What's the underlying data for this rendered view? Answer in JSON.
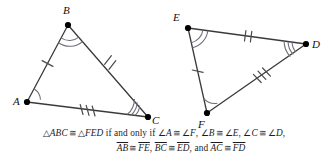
{
  "figure": {
    "stroke_color": "#3a3a3a",
    "mark_color": "#555555",
    "arc_color": "#6f6f7a",
    "vertex_dot_color": "#000000"
  },
  "triangle_left": {
    "name": "ABC",
    "vertices": [
      {
        "label": "A",
        "x": 27,
        "y": 102,
        "label_x": 13,
        "label_y": 105,
        "arcs": 1
      },
      {
        "label": "B",
        "x": 68,
        "y": 25,
        "label_x": 63,
        "label_y": 14,
        "arcs": 2
      },
      {
        "label": "C",
        "x": 148,
        "y": 117,
        "label_x": 152,
        "label_y": 124,
        "arcs": 3
      }
    ],
    "sides": [
      {
        "name": "AB",
        "from": "A",
        "to": "B",
        "ticks": 1
      },
      {
        "name": "BC",
        "from": "B",
        "to": "C",
        "ticks": 2
      },
      {
        "name": "AC",
        "from": "A",
        "to": "C",
        "ticks": 3
      }
    ]
  },
  "triangle_right": {
    "name": "FED",
    "vertices": [
      {
        "label": "E",
        "x": 188,
        "y": 28,
        "label_x": 175,
        "label_y": 21,
        "arcs": 2
      },
      {
        "label": "D",
        "x": 306,
        "y": 44,
        "label_x": 312,
        "label_y": 47,
        "arcs": 3
      },
      {
        "label": "F",
        "x": 207,
        "y": 113,
        "label_x": 199,
        "label_y": 127,
        "arcs": 1
      }
    ],
    "sides": [
      {
        "name": "ED",
        "from": "E",
        "to": "D",
        "ticks": 2
      },
      {
        "name": "EF",
        "from": "E",
        "to": "F",
        "ticks": 1
      },
      {
        "name": "FD",
        "from": "F",
        "to": "D",
        "ticks": 3
      }
    ]
  },
  "caption": {
    "line1": {
      "tri1": "ABC",
      "cong1": "≅",
      "tri2": "FED",
      "connector": "if and only if",
      "angle_pairs": [
        {
          "left": "A",
          "right": "F",
          "sep": ","
        },
        {
          "left": "B",
          "right": "E",
          "sep": ","
        },
        {
          "left": "C",
          "right": "D",
          "sep": ","
        }
      ]
    },
    "line2": {
      "segment_pairs": [
        {
          "left": "AB",
          "right": "FE",
          "sep": ","
        },
        {
          "left": "BC",
          "right": "ED",
          "sep": ","
        }
      ],
      "and_word": "and",
      "final_pair": {
        "left": "AC",
        "right": "FD"
      }
    },
    "symbols": {
      "triangle": "△",
      "congruent": "≅",
      "angle": "∠"
    }
  }
}
